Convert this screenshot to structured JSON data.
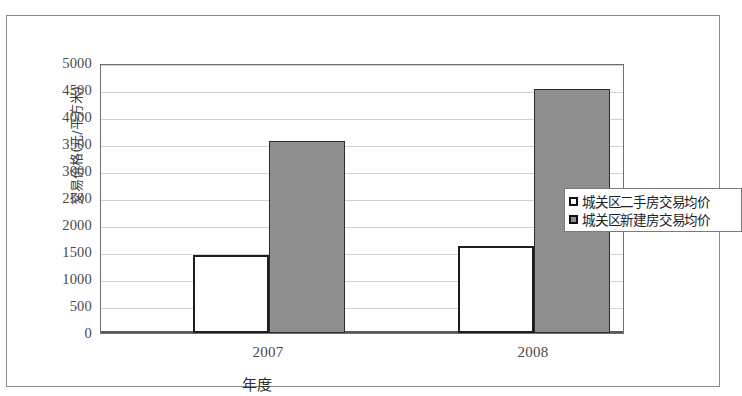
{
  "chart_data": {
    "type": "bar",
    "title": "",
    "xlabel": "年度",
    "ylabel": "交易价格(元/平方米)",
    "categories": [
      "2007",
      "2008"
    ],
    "series": [
      {
        "name": "城关区二手房交易均价",
        "values": [
          1450,
          1620
        ],
        "color": "#ffffff"
      },
      {
        "name": "城关区新建房交易均价",
        "values": [
          3550,
          4520
        ],
        "color": "#8f8f8f"
      }
    ],
    "ylim": [
      0,
      5000
    ],
    "ytick_values": [
      0,
      500,
      1000,
      1500,
      2000,
      2500,
      3000,
      3500,
      4000,
      4500,
      5000
    ],
    "ytick_labels": [
      "0",
      "500",
      "1000",
      "1500",
      "2000",
      "2500",
      "3000",
      "3500",
      "4000",
      "4500",
      "5000"
    ],
    "grid": true,
    "legend_position": "right-middle",
    "legend_entries": [
      "城关区二手房交易均价",
      "城关区新建房交易均价"
    ]
  }
}
